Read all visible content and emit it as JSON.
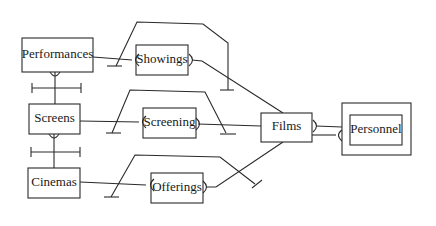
{
  "diagram": {
    "type": "entity-relationship",
    "entities": {
      "performances": {
        "label": "Performances"
      },
      "showings": {
        "label": "Showings"
      },
      "screens": {
        "label": "Screens"
      },
      "screening": {
        "label": "Screening"
      },
      "films": {
        "label": "Films"
      },
      "personnel": {
        "label": "Personnel"
      },
      "cinemas": {
        "label": "Cinemas"
      },
      "offerings": {
        "label": "Offerings"
      }
    },
    "relationships": [
      {
        "from": "Performances",
        "to": "Showings"
      },
      {
        "from": "Showings",
        "to": "Films"
      },
      {
        "from": "Performances",
        "to": "Screens"
      },
      {
        "from": "Screens",
        "to": "Screening"
      },
      {
        "from": "Screening",
        "to": "Films"
      },
      {
        "from": "Screens",
        "to": "Cinemas"
      },
      {
        "from": "Cinemas",
        "to": "Offerings"
      },
      {
        "from": "Offerings",
        "to": "Films"
      },
      {
        "from": "Films",
        "to": "Personnel"
      },
      {
        "from": "Films",
        "to": "Personnel"
      }
    ]
  }
}
